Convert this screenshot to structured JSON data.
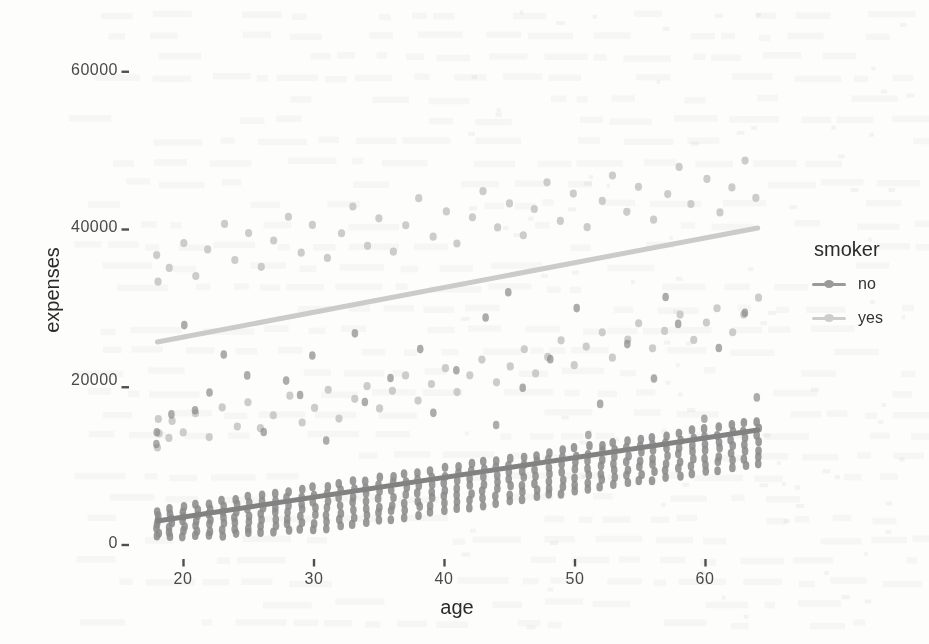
{
  "chart_data": {
    "type": "scatter",
    "title": "",
    "xlabel": "age",
    "ylabel": "expenses",
    "x_axis": {
      "tick_labels": [
        "20",
        "30",
        "40",
        "50",
        "60"
      ],
      "tick_values": [
        20,
        30,
        40,
        50,
        60
      ],
      "range": [
        15.5,
        66.5
      ]
    },
    "y_axis": {
      "tick_labels": [
        "0",
        "20000",
        "40000",
        "60000"
      ],
      "tick_values": [
        0,
        20000,
        40000,
        60000
      ],
      "range": [
        -1600,
        64600
      ]
    },
    "grid": "off",
    "legend": {
      "title": "smoker",
      "position": "right",
      "entries": [
        {
          "label": "no",
          "color": "#9a9a9a"
        },
        {
          "label": "yes",
          "color": "#cdcdcd"
        }
      ]
    },
    "series": [
      {
        "name": "no",
        "point_color": "#8c8c8c",
        "line_color": "#828282",
        "trend": {
          "x": [
            18,
            64
          ],
          "y": [
            3050,
            14580
          ]
        },
        "columns": [
          [
            18,
            1100,
            4270
          ],
          [
            19,
            1100,
            4520
          ],
          [
            20,
            1100,
            4770
          ],
          [
            21,
            1150,
            5010
          ],
          [
            22,
            1200,
            5260
          ],
          [
            23,
            1250,
            5510
          ],
          [
            24,
            1350,
            5760
          ],
          [
            25,
            1450,
            6010
          ],
          [
            26,
            1550,
            6250
          ],
          [
            27,
            1650,
            6500
          ],
          [
            28,
            1750,
            6750
          ],
          [
            29,
            1850,
            7000
          ],
          [
            30,
            1950,
            7250
          ],
          [
            31,
            2100,
            7490
          ],
          [
            32,
            2340,
            7740
          ],
          [
            33,
            2590,
            7990
          ],
          [
            34,
            2840,
            8240
          ],
          [
            35,
            3090,
            8490
          ],
          [
            36,
            3330,
            8730
          ],
          [
            37,
            3580,
            8980
          ],
          [
            38,
            3830,
            9230
          ],
          [
            39,
            4080,
            9480
          ],
          [
            40,
            4330,
            9730
          ],
          [
            41,
            4570,
            9970
          ],
          [
            42,
            4820,
            10220
          ],
          [
            43,
            5070,
            10470
          ],
          [
            44,
            5320,
            10720
          ],
          [
            45,
            5570,
            10970
          ],
          [
            46,
            5810,
            11210
          ],
          [
            47,
            6060,
            11460
          ],
          [
            48,
            6310,
            11710
          ],
          [
            49,
            6560,
            11960
          ],
          [
            50,
            6810,
            12210
          ],
          [
            51,
            7050,
            12450
          ],
          [
            52,
            7300,
            12700
          ],
          [
            53,
            7550,
            12950
          ],
          [
            54,
            7800,
            13200
          ],
          [
            55,
            8050,
            13450
          ],
          [
            56,
            8290,
            13690
          ],
          [
            57,
            8540,
            13940
          ],
          [
            58,
            8790,
            14190
          ],
          [
            59,
            9040,
            14440
          ],
          [
            60,
            9290,
            14690
          ],
          [
            61,
            9530,
            14930
          ],
          [
            62,
            9780,
            15180
          ],
          [
            63,
            10030,
            15430
          ],
          [
            64,
            10280,
            15680
          ]
        ],
        "outliers": [
          [
            18,
            12900
          ],
          [
            18,
            14300
          ],
          [
            19,
            16500
          ],
          [
            20,
            27800
          ],
          [
            21,
            17000
          ],
          [
            22,
            19500
          ],
          [
            23,
            24300
          ],
          [
            25,
            21500
          ],
          [
            26,
            14500
          ],
          [
            28,
            20800
          ],
          [
            29,
            18900
          ],
          [
            30,
            24200
          ],
          [
            31,
            13200
          ],
          [
            33,
            26700
          ],
          [
            34,
            18300
          ],
          [
            36,
            21300
          ],
          [
            38,
            25000
          ],
          [
            39,
            16800
          ],
          [
            41,
            22100
          ],
          [
            43,
            28900
          ],
          [
            44,
            15200
          ],
          [
            45,
            32100
          ],
          [
            46,
            19800
          ],
          [
            48,
            23600
          ],
          [
            50,
            30200
          ],
          [
            51,
            13900
          ],
          [
            52,
            17900
          ],
          [
            54,
            25400
          ],
          [
            56,
            21000
          ],
          [
            57,
            31500
          ],
          [
            58,
            27900
          ],
          [
            60,
            16100
          ],
          [
            61,
            24800
          ],
          [
            63,
            29300
          ],
          [
            64,
            18600
          ]
        ]
      },
      {
        "name": "yes",
        "point_color": "#c3c3c3",
        "line_color": "#cbcbcb",
        "trend": {
          "x": [
            18,
            64
          ],
          "y": [
            25740,
            40200
          ]
        },
        "points": [
          [
            18,
            14300
          ],
          [
            18,
            12200
          ],
          [
            18,
            16100
          ],
          [
            19,
            13500
          ],
          [
            19,
            15800
          ],
          [
            20,
            14100
          ],
          [
            21,
            16600
          ],
          [
            22,
            13800
          ],
          [
            23,
            17300
          ],
          [
            24,
            15200
          ],
          [
            25,
            18100
          ],
          [
            26,
            14900
          ],
          [
            27,
            16400
          ],
          [
            28,
            18800
          ],
          [
            29,
            15600
          ],
          [
            30,
            17500
          ],
          [
            31,
            19600
          ],
          [
            32,
            16200
          ],
          [
            33,
            18400
          ],
          [
            34,
            20300
          ],
          [
            35,
            17200
          ],
          [
            36,
            19500
          ],
          [
            37,
            21400
          ],
          [
            38,
            18300
          ],
          [
            39,
            20600
          ],
          [
            40,
            22500
          ],
          [
            41,
            19400
          ],
          [
            42,
            21700
          ],
          [
            43,
            23600
          ],
          [
            44,
            20500
          ],
          [
            45,
            22800
          ],
          [
            46,
            24700
          ],
          [
            47,
            21600
          ],
          [
            48,
            23900
          ],
          [
            49,
            25800
          ],
          [
            50,
            22700
          ],
          [
            51,
            25000
          ],
          [
            52,
            26900
          ],
          [
            53,
            23800
          ],
          [
            54,
            26100
          ],
          [
            55,
            28000
          ],
          [
            56,
            24900
          ],
          [
            57,
            27200
          ],
          [
            58,
            29100
          ],
          [
            59,
            26000
          ],
          [
            60,
            28300
          ],
          [
            61,
            30200
          ],
          [
            62,
            27100
          ],
          [
            63,
            29400
          ],
          [
            64,
            31300
          ],
          [
            18,
            33500
          ],
          [
            18,
            36800
          ],
          [
            19,
            35100
          ],
          [
            20,
            38400
          ],
          [
            21,
            34200
          ],
          [
            22,
            37500
          ],
          [
            23,
            40800
          ],
          [
            24,
            36100
          ],
          [
            25,
            39400
          ],
          [
            26,
            35200
          ],
          [
            27,
            38500
          ],
          [
            28,
            41800
          ],
          [
            29,
            37100
          ],
          [
            30,
            40400
          ],
          [
            31,
            36200
          ],
          [
            32,
            39500
          ],
          [
            33,
            42800
          ],
          [
            34,
            38100
          ],
          [
            35,
            41400
          ],
          [
            36,
            37200
          ],
          [
            37,
            40500
          ],
          [
            38,
            43800
          ],
          [
            39,
            39100
          ],
          [
            40,
            42400
          ],
          [
            41,
            38200
          ],
          [
            42,
            41500
          ],
          [
            43,
            44800
          ],
          [
            44,
            40100
          ],
          [
            45,
            43400
          ],
          [
            46,
            39200
          ],
          [
            47,
            42500
          ],
          [
            48,
            45800
          ],
          [
            49,
            41100
          ],
          [
            50,
            44400
          ],
          [
            51,
            40200
          ],
          [
            52,
            43500
          ],
          [
            53,
            46800
          ],
          [
            54,
            42100
          ],
          [
            55,
            45400
          ],
          [
            56,
            41200
          ],
          [
            57,
            44500
          ],
          [
            58,
            47800
          ],
          [
            59,
            43100
          ],
          [
            60,
            46400
          ],
          [
            61,
            42200
          ],
          [
            62,
            45500
          ],
          [
            63,
            48800
          ],
          [
            64,
            44100
          ]
        ]
      }
    ]
  },
  "colors": {
    "tick_text": "#4a4a4a",
    "axis_title_text": "#2b2b2b",
    "tick_mark": "#4f4f4f",
    "background": "#fdfdfc"
  }
}
